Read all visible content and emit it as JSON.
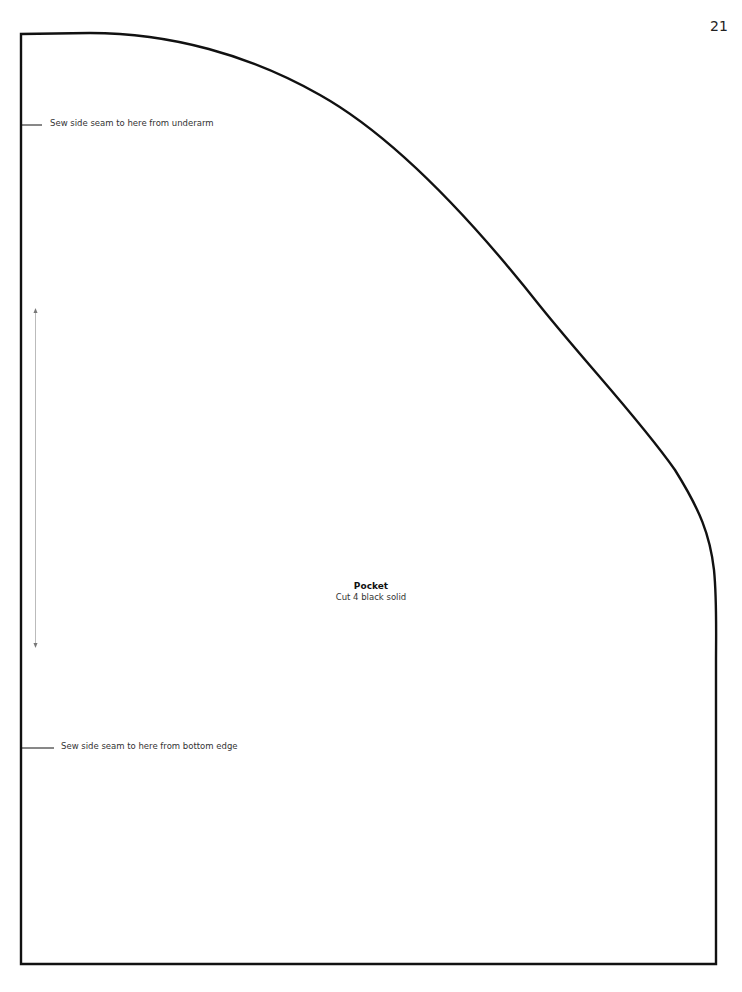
{
  "page": {
    "number": "21"
  },
  "pattern_piece": {
    "name": "Pocket",
    "instruction": "Cut 4 black solid"
  },
  "markers": [
    {
      "label": "Sew side seam to here from underarm"
    },
    {
      "label": "Sew side seam to here from bottom edge"
    }
  ],
  "grainline": {
    "type": "double-arrow",
    "orientation": "vertical"
  },
  "colors": {
    "outline": "#111111",
    "grainline": "#999999",
    "text": "#333333"
  }
}
